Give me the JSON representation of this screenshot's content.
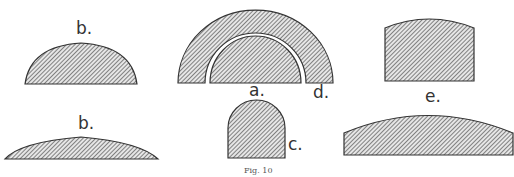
{
  "figure": {
    "caption": "Fig. 10",
    "labels": {
      "b_top": "b.",
      "b_bottom": "b.",
      "a": "a.",
      "c": "c.",
      "d": "d.",
      "e": "e."
    },
    "colors": {
      "stroke": "#333333",
      "hatch": "#4a4a4a",
      "background": "#ffffff"
    }
  }
}
